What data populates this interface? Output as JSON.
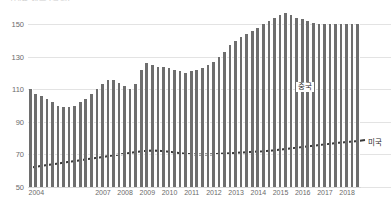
{
  "title_clipped": "그래프 제목 (잘림)",
  "axis": {
    "y_ticks": [
      150,
      130,
      110,
      90,
      70,
      50
    ],
    "y_min": 50,
    "y_max": 160,
    "x_ticks": [
      "2004",
      "2007",
      "2008",
      "2009",
      "2010",
      "2011",
      "2012",
      "2013",
      "2014",
      "2015",
      "2016",
      "2017",
      "2018"
    ]
  },
  "labels": {
    "china": "중국",
    "usa": "미국"
  },
  "colors": {
    "bar": "#6e6e6e",
    "line": "#3a3a3a",
    "grid": "#e3e3e3",
    "tick_text": "#6b6b6b"
  },
  "chart_data": {
    "type": "bar",
    "title": "",
    "xlabel": "",
    "ylabel": "",
    "ylim": [
      50,
      160
    ],
    "grid": true,
    "legend": "inline-annotations",
    "categories": [
      "2004Q1",
      "2004Q2",
      "2004Q3",
      "2004Q4",
      "2005Q1",
      "2005Q2",
      "2005Q3",
      "2005Q4",
      "2006Q1",
      "2006Q2",
      "2006Q3",
      "2006Q4",
      "2007Q1",
      "2007Q2",
      "2007Q3",
      "2007Q4",
      "2008Q1",
      "2008Q2",
      "2008Q3",
      "2008Q4",
      "2009Q1",
      "2009Q2",
      "2009Q3",
      "2009Q4",
      "2010Q1",
      "2010Q2",
      "2010Q3",
      "2010Q4",
      "2011Q1",
      "2011Q2",
      "2011Q3",
      "2011Q4",
      "2012Q1",
      "2012Q2",
      "2012Q3",
      "2012Q4",
      "2013Q1",
      "2013Q2",
      "2013Q3",
      "2013Q4",
      "2014Q1",
      "2014Q2",
      "2014Q3",
      "2014Q4",
      "2015Q1",
      "2015Q2",
      "2015Q3",
      "2015Q4",
      "2016Q1",
      "2016Q2",
      "2016Q3",
      "2016Q4",
      "2017Q1",
      "2017Q2",
      "2017Q3",
      "2017Q4",
      "2018Q1",
      "2018Q2",
      "2018Q3",
      "2018Q4"
    ],
    "series": [
      {
        "name": "중국",
        "type": "bar",
        "values": [
          110,
          107,
          106,
          104,
          102,
          100,
          99,
          99,
          100,
          102,
          104,
          107,
          110,
          113,
          116,
          116,
          114,
          112,
          110,
          113,
          122,
          126,
          125,
          124,
          124,
          123,
          122,
          121,
          120,
          121,
          122,
          123,
          125,
          127,
          130,
          133,
          137,
          140,
          142,
          144,
          146,
          148,
          150,
          152,
          154,
          156,
          157,
          156,
          154,
          153,
          152,
          151,
          150,
          150,
          150,
          150,
          150,
          150,
          150,
          150
        ]
      },
      {
        "name": "미국",
        "type": "line",
        "values": [
          62,
          62.5,
          63,
          63.5,
          64,
          64.5,
          65,
          65.5,
          66,
          66.5,
          67,
          67.5,
          68,
          68.5,
          69,
          69.5,
          70,
          70.5,
          71,
          71.5,
          72,
          72.3,
          72.5,
          72.3,
          72,
          71.6,
          71.2,
          70.8,
          70.4,
          70.2,
          70,
          70,
          70,
          70.2,
          70.4,
          70.6,
          70.8,
          71,
          71.2,
          71.4,
          71.6,
          71.8,
          72,
          72.3,
          72.6,
          73,
          73.4,
          73.8,
          74.2,
          74.6,
          75,
          75.4,
          75.8,
          76.2,
          76.6,
          77,
          77.3,
          77.6,
          77.9,
          78.2
        ]
      }
    ]
  }
}
